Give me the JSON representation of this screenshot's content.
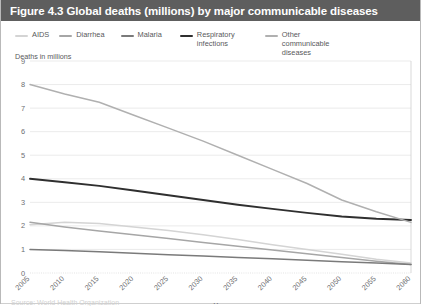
{
  "figure": {
    "title": "Figure 4.3 Global deaths (millions) by major communicable diseases",
    "title_bar_color": "#5e5e5e",
    "footer_note": "Source: World Health Organization"
  },
  "legend": {
    "position": "top",
    "items": [
      {
        "label": "AIDS",
        "color": "#d4d4d4",
        "icon": "line-swatch-icon"
      },
      {
        "label": "Diarrhea",
        "color": "#a6a6a6",
        "icon": "line-swatch-icon"
      },
      {
        "label": "Malaria",
        "color": "#7a7a7a",
        "icon": "line-swatch-icon"
      },
      {
        "label": "Respiratory infections",
        "color": "#2f2f2f",
        "icon": "line-swatch-icon"
      },
      {
        "label": "Other communicable diseases",
        "color": "#b0b0b0",
        "icon": "line-swatch-icon"
      }
    ]
  },
  "axes": {
    "y_axis_title": "Deaths in millions",
    "x_axis_title": "Year",
    "y_ticks": [
      "0",
      "1",
      "2",
      "3",
      "4",
      "5",
      "6",
      "7",
      "8",
      "9"
    ],
    "x_ticks": [
      "2005",
      "2010",
      "2015",
      "2020",
      "2025",
      "2030",
      "2035",
      "2040",
      "2045",
      "2050",
      "2055",
      "2060"
    ],
    "x_tick_rotation": -45
  },
  "chart_data": {
    "type": "line",
    "title": "Figure 4.3 Global deaths (millions) by major communicable diseases",
    "xlabel": "Year",
    "ylabel": "Deaths in millions",
    "x": [
      2005,
      2010,
      2015,
      2020,
      2025,
      2030,
      2035,
      2040,
      2045,
      2050,
      2055,
      2060
    ],
    "xlim": [
      2005,
      2060
    ],
    "ylim": [
      0,
      9
    ],
    "grid": true,
    "legend_position": "top",
    "series": [
      {
        "name": "AIDS",
        "color": "#d4d4d4",
        "values": [
          2.05,
          2.15,
          2.1,
          1.95,
          1.8,
          1.62,
          1.42,
          1.2,
          1.0,
          0.8,
          0.58,
          0.42
        ]
      },
      {
        "name": "Diarrhea",
        "color": "#a6a6a6",
        "values": [
          2.15,
          1.95,
          1.78,
          1.62,
          1.46,
          1.3,
          1.14,
          0.98,
          0.82,
          0.66,
          0.5,
          0.36
        ]
      },
      {
        "name": "Malaria",
        "color": "#7a7a7a",
        "values": [
          1.0,
          0.95,
          0.9,
          0.84,
          0.78,
          0.72,
          0.66,
          0.6,
          0.54,
          0.48,
          0.42,
          0.36
        ]
      },
      {
        "name": "Respiratory infections",
        "color": "#2f2f2f",
        "values": [
          4.0,
          3.85,
          3.7,
          3.5,
          3.3,
          3.1,
          2.9,
          2.72,
          2.55,
          2.4,
          2.3,
          2.25
        ]
      },
      {
        "name": "Other communicable diseases",
        "color": "#b0b0b0",
        "values": [
          8.0,
          7.6,
          7.25,
          6.7,
          6.15,
          5.6,
          5.0,
          4.4,
          3.8,
          3.1,
          2.6,
          2.15
        ]
      }
    ]
  }
}
